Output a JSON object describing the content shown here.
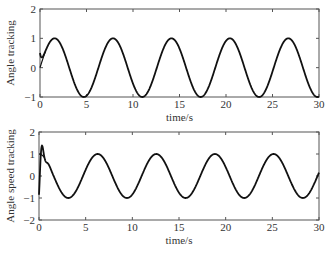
{
  "chart_data": [
    {
      "type": "line",
      "title": "",
      "xlabel": "time/s",
      "ylabel": "Angle tracking",
      "xlim": [
        0,
        30
      ],
      "ylim": [
        -1,
        2
      ],
      "xticks": [
        "0",
        "5",
        "10",
        "15",
        "20",
        "25",
        "30"
      ],
      "yticks": [
        "-1",
        "0",
        "1",
        "2"
      ],
      "grid": false,
      "series": [
        {
          "name": "reference",
          "function": "sin(t)",
          "x": [
            0,
            1.57,
            4.71,
            7.85,
            11.0,
            14.14,
            17.28,
            20.42,
            23.56,
            26.7,
            29.85,
            30
          ],
          "values": [
            0,
            1,
            -1,
            1,
            -1,
            1,
            -1,
            1,
            -1,
            1,
            -1,
            -0.99
          ]
        },
        {
          "name": "actual",
          "function": "sin(t) with initial offset 0.5 converging quickly",
          "x": [
            0,
            0.3,
            1.57,
            4.71,
            7.85,
            30
          ],
          "values": [
            0.5,
            0.4,
            1,
            -1,
            1,
            -0.99
          ]
        }
      ]
    },
    {
      "type": "line",
      "title": "",
      "xlabel": "time/s",
      "ylabel": "Angle speed tracking",
      "xlim": [
        0,
        30
      ],
      "ylim": [
        -2,
        2
      ],
      "xticks": [
        "0",
        "5",
        "10",
        "15",
        "20",
        "25",
        "30"
      ],
      "yticks": [
        "-2",
        "-1",
        "0",
        "1",
        "2"
      ],
      "grid": false,
      "series": [
        {
          "name": "reference",
          "function": "cos(t)",
          "x": [
            0,
            3.14,
            6.28,
            9.42,
            12.57,
            15.71,
            18.85,
            21.99,
            25.13,
            28.27,
            30
          ],
          "values": [
            1,
            -1,
            1,
            -1,
            1,
            -1,
            1,
            -1,
            1,
            -1,
            0.15
          ]
        },
        {
          "name": "actual",
          "function": "cos(t) with initial transient dip to about -0.8",
          "x": [
            0,
            0.15,
            0.5,
            3.14,
            6.28,
            30
          ],
          "values": [
            0,
            -0.8,
            0.8,
            -1,
            1,
            0.15
          ]
        }
      ]
    }
  ]
}
